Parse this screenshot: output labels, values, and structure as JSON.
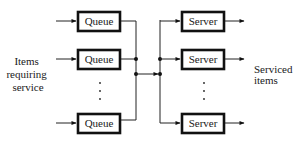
{
  "diagram": {
    "input_label": [
      "Items",
      "requiring",
      "service"
    ],
    "output_label": [
      "Serviced",
      "items"
    ],
    "queues": [
      {
        "label": "Queue"
      },
      {
        "label": "Queue"
      },
      {
        "label": "Queue"
      }
    ],
    "servers": [
      {
        "label": "Server"
      },
      {
        "label": "Server"
      },
      {
        "label": "Server"
      }
    ],
    "ellipsis": "⋮"
  }
}
